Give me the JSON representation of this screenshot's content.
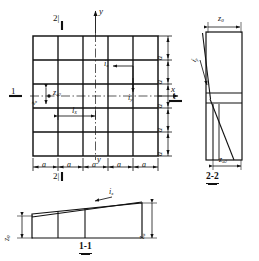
{
  "figure": {
    "type": "engineering-drawing",
    "line_color": "#111111",
    "background": "#ffffff"
  },
  "plan": {
    "name": "plan-view",
    "grid": {
      "rows": 5,
      "cols": 5
    },
    "axis_y_label": "y",
    "axis_y_label_bottom": "y",
    "axis_x_label": "x",
    "section_marker_top": "2|",
    "section_marker_bottom": "2|",
    "section_marker_left": "1",
    "section_marker_right": "1",
    "label_ix": "i",
    "label_ix_sub": "x",
    "label_iy": "i",
    "label_iy_sub": "y",
    "label_lx": "l",
    "label_lx_sub": "x",
    "label_za2": "z",
    "label_za2_sub": "a2",
    "label_small_dim": "z",
    "label_small_dim_sub": "a",
    "dim_right": [
      "a",
      "a",
      "a",
      "a",
      "a"
    ],
    "dim_bottom": [
      "a",
      "a",
      "a",
      "a",
      "a"
    ]
  },
  "section_11": {
    "name": "section-1-1",
    "title": "1-1",
    "label_ix": "i",
    "label_ix_sub": "x",
    "label_left": "z",
    "label_left_sub": "0",
    "label_right": "z",
    "label_right_sub": "a"
  },
  "section_22": {
    "name": "section-2-2",
    "title": "2-2",
    "label_iy": "i",
    "label_iy_sub": "y",
    "label_top": "z",
    "label_top_sub": "0",
    "label_bottom": "z",
    "label_bottom_sub": "a2"
  }
}
